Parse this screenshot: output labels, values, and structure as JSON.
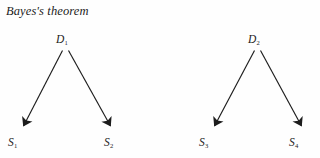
{
  "figure": {
    "title": "Bayes's theorem",
    "background_color": "#fefefe",
    "ink_color": "#1c1c1c"
  },
  "diagram_data": {
    "type": "diagram",
    "description": "Two separate two-branch directed trees illustrating Bayes's theorem",
    "trees": [
      {
        "id": "tree-left",
        "root": {
          "label": "D",
          "subscript": "1",
          "display": "D1"
        },
        "leaves": [
          {
            "label": "S",
            "subscript": "1",
            "display": "S1"
          },
          {
            "label": "S",
            "subscript": "2",
            "display": "S2"
          }
        ],
        "edges": [
          {
            "from": "D1",
            "to": "S1",
            "arrow": true
          },
          {
            "from": "D1",
            "to": "S2",
            "arrow": true
          }
        ]
      },
      {
        "id": "tree-right",
        "root": {
          "label": "D",
          "subscript": "2",
          "display": "D2"
        },
        "leaves": [
          {
            "label": "S",
            "subscript": "3",
            "display": "S3"
          },
          {
            "label": "S",
            "subscript": "4",
            "display": "S4"
          }
        ],
        "edges": [
          {
            "from": "D2",
            "to": "S3",
            "arrow": true
          },
          {
            "from": "D2",
            "to": "S4",
            "arrow": true
          }
        ]
      }
    ]
  },
  "labels": {
    "d1": {
      "base": "D",
      "sub": "1"
    },
    "d2": {
      "base": "D",
      "sub": "2"
    },
    "s1": {
      "base": "S",
      "sub": "1"
    },
    "s2": {
      "base": "S",
      "sub": "2"
    },
    "s3": {
      "base": "S",
      "sub": "3"
    },
    "s4": {
      "base": "S",
      "sub": "4"
    }
  }
}
